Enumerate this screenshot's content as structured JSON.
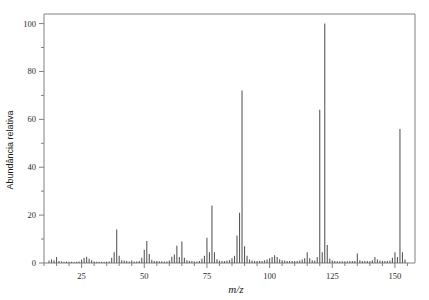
{
  "chart_data": {
    "type": "bar",
    "title": "",
    "subtitle": "",
    "xlabel": "m/z",
    "ylabel": "Abundância relativa",
    "xlim": [
      10,
      158
    ],
    "ylim": [
      0,
      104
    ],
    "grid": false,
    "legend": null,
    "x_ticks_major": [
      25,
      50,
      75,
      100,
      125,
      150
    ],
    "x_tick_labels": [
      "25",
      "50",
      "75",
      "100",
      "125",
      "150"
    ],
    "x_tick_minor_step": 5,
    "y_ticks_major": [
      0,
      20,
      40,
      60,
      80,
      100
    ],
    "y_tick_labels": [
      "0",
      "20",
      "40",
      "60",
      "80",
      "100"
    ],
    "y_ticks_minor": [
      10,
      30,
      50,
      70,
      90
    ],
    "series_name": "mass spectrum",
    "line_color": "#5a5a5a",
    "axis_color": "#808080",
    "x": [
      12,
      13,
      14,
      15,
      16,
      17,
      18,
      19,
      20,
      21,
      22,
      23,
      24,
      25,
      26,
      27,
      28,
      29,
      30,
      31,
      32,
      33,
      34,
      35,
      36,
      37,
      38,
      39,
      40,
      41,
      42,
      43,
      44,
      45,
      46,
      47,
      48,
      49,
      50,
      51,
      52,
      53,
      54,
      55,
      56,
      57,
      58,
      59,
      60,
      61,
      62,
      63,
      64,
      65,
      66,
      67,
      68,
      69,
      70,
      71,
      72,
      73,
      74,
      75,
      76,
      77,
      78,
      79,
      80,
      81,
      82,
      83,
      84,
      85,
      86,
      87,
      88,
      89,
      90,
      91,
      92,
      93,
      94,
      95,
      96,
      97,
      98,
      99,
      100,
      101,
      102,
      103,
      104,
      105,
      106,
      107,
      108,
      109,
      110,
      111,
      112,
      113,
      114,
      115,
      116,
      117,
      118,
      119,
      120,
      121,
      122,
      123,
      124,
      125,
      126,
      127,
      128,
      129,
      130,
      131,
      132,
      133,
      134,
      135,
      136,
      137,
      138,
      139,
      140,
      141,
      142,
      143,
      144,
      145,
      146,
      147,
      148,
      149,
      150,
      151,
      152,
      153,
      154
    ],
    "y": [
      1.0,
      1.5,
      1.2,
      2.5,
      0.8,
      0.6,
      0.5,
      0.6,
      0.5,
      0.5,
      0.4,
      0.5,
      0.6,
      1.5,
      2.2,
      2.6,
      1.8,
      1.2,
      0.6,
      0.5,
      0.5,
      0.5,
      0.5,
      0.5,
      0.6,
      2.2,
      4.5,
      14.0,
      3.0,
      1.2,
      1.0,
      0.8,
      0.6,
      1.0,
      0.6,
      0.6,
      0.8,
      2.2,
      5.5,
      9.2,
      3.8,
      1.4,
      0.8,
      0.8,
      0.7,
      0.7,
      0.6,
      0.6,
      1.0,
      2.6,
      3.6,
      7.2,
      2.5,
      9.0,
      2.2,
      1.2,
      0.8,
      0.8,
      0.6,
      0.6,
      0.8,
      1.8,
      3.0,
      10.5,
      4.5,
      24.0,
      4.5,
      1.6,
      1.0,
      0.8,
      0.8,
      1.0,
      1.2,
      2.0,
      3.0,
      11.5,
      21.0,
      72.0,
      7.0,
      3.0,
      1.5,
      1.0,
      0.8,
      0.8,
      0.8,
      0.8,
      1.2,
      1.5,
      2.0,
      2.5,
      3.2,
      2.5,
      1.6,
      1.2,
      1.0,
      0.8,
      0.8,
      0.8,
      0.8,
      0.8,
      1.0,
      1.5,
      2.0,
      4.5,
      2.0,
      1.2,
      1.0,
      2.5,
      64.0,
      4.5,
      100.0,
      7.5,
      1.8,
      1.0,
      0.8,
      0.7,
      0.7,
      0.7,
      0.7,
      0.7,
      0.8,
      0.8,
      0.8,
      4.0,
      1.2,
      0.8,
      0.8,
      0.8,
      0.8,
      1.2,
      2.5,
      1.5,
      1.0,
      0.8,
      0.8,
      0.8,
      1.0,
      2.2,
      4.5,
      2.5,
      56.0,
      4.5,
      1.5,
      0.8,
      0.7
    ],
    "notable_peaks": [
      {
        "mz": 39,
        "intensity": 14.0
      },
      {
        "mz": 51,
        "intensity": 9.2
      },
      {
        "mz": 63,
        "intensity": 7.2
      },
      {
        "mz": 65,
        "intensity": 9.0
      },
      {
        "mz": 75,
        "intensity": 10.5
      },
      {
        "mz": 77,
        "intensity": 24.0
      },
      {
        "mz": 87,
        "intensity": 11.5
      },
      {
        "mz": 88,
        "intensity": 21.0
      },
      {
        "mz": 89,
        "intensity": 72.0
      },
      {
        "mz": 118,
        "intensity": 64.0
      },
      {
        "mz": 120,
        "intensity": 100.0
      },
      {
        "mz": 150,
        "intensity": 56.0
      }
    ],
    "base_peak_mz": 120,
    "base_peak_intensity": 100
  }
}
